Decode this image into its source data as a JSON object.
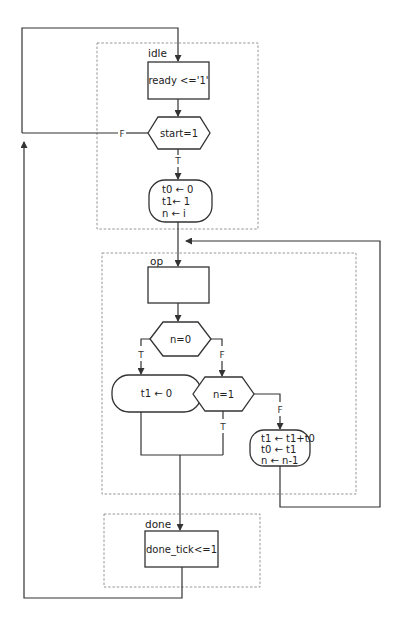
{
  "diagram": {
    "states": {
      "idle": {
        "label": "idle",
        "action": "ready <='1'",
        "decision": "start=1",
        "false_label": "F",
        "true_label": "T",
        "conditional_output": [
          "t0 ← 0",
          "t1← 1",
          "n ← i"
        ]
      },
      "op": {
        "label": "op",
        "action": "",
        "decision1": "n=0",
        "decision1_true": "T",
        "decision1_false": "F",
        "true_output": "t1 ← 0",
        "decision2": "n=1",
        "decision2_true": "T",
        "decision2_false": "F",
        "false_output": [
          "t1 ← t1+t0",
          "t0 ← t1",
          "n ← n-1"
        ]
      },
      "done": {
        "label": "done",
        "action": "done_tick<=1"
      }
    },
    "colors": {
      "line": "#333333",
      "dashed_border": "#8a8a8a",
      "background": "#ffffff"
    }
  }
}
